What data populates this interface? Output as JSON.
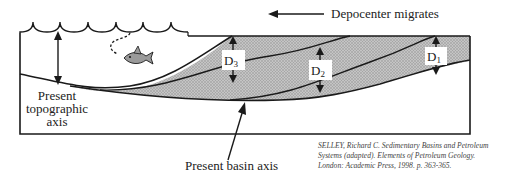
{
  "diagram": {
    "labels": {
      "depocenter_migrates": "Depocenter migrates",
      "topographic_axis": [
        "Present",
        "topographic",
        "axis"
      ],
      "basin_axis": "Present basin axis"
    },
    "thickness_markers": [
      {
        "letter": "D",
        "sub": "3"
      },
      {
        "letter": "D",
        "sub": "2"
      },
      {
        "letter": "D",
        "sub": "1"
      }
    ],
    "citation": [
      "SELLEY, Richard C. Sedimentary Basins and Petroleum",
      "Systems (adapted). Elements of Petroleum Geology.",
      "London: Academic Press, 1998. p. 363-365."
    ],
    "icons": {
      "fish": "fish-icon",
      "waves": "water-surface-waves",
      "arrow_left": "arrow-left-icon"
    },
    "colors": {
      "line": "#1a1a1a",
      "sediment_fill": "#b8b8b8",
      "sediment_dot": "#8a8a8a",
      "fish_body": "#9a9a9a",
      "text": "#222222"
    }
  }
}
